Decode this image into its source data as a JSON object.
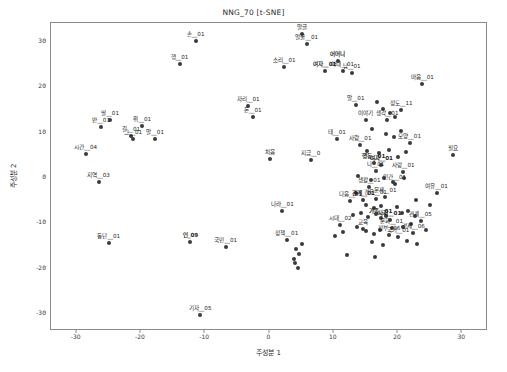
{
  "figure": {
    "title": "NNG_70 [t-SNE]",
    "background_color": "#ffffff",
    "frame_color": "#8a8a8a",
    "marker_color": "#3a3a3a"
  },
  "axes": {
    "xlabel": "주성분 1",
    "ylabel": "주성분 2",
    "xlim": [
      -34,
      34
    ],
    "ylim": [
      -34,
      34
    ],
    "xticks": [
      -30,
      -20,
      -10,
      0,
      10,
      20,
      30
    ],
    "yticks": [
      -30,
      -20,
      -10,
      0,
      10,
      20,
      30
    ],
    "xtick_labels": [
      "-30",
      "-20",
      "-10",
      "0",
      "10",
      "20",
      "30"
    ],
    "ytick_labels": [
      "-30",
      "-20",
      "-10",
      "0",
      "10",
      "20",
      "30"
    ],
    "grid": false
  },
  "chart_data": {
    "type": "scatter",
    "title": "NNG_70 [t-SNE]",
    "xlabel": "주성분 1",
    "ylabel": "주성분 2",
    "xlim": [
      -34,
      34
    ],
    "ylim": [
      -34,
      34
    ],
    "grid": false,
    "legend": null,
    "points": [
      {
        "label": "손__01",
        "x": -11.5,
        "y": 30.0,
        "bold": false
      },
      {
        "label": "말글",
        "x": 5.0,
        "y": 31.5,
        "bold": false
      },
      {
        "label": "얼굴__01",
        "x": 5.8,
        "y": 29.3,
        "bold": false
      },
      {
        "label": "행__01",
        "x": -14.0,
        "y": 25.0,
        "bold": false
      },
      {
        "label": "소리__01",
        "x": 2.3,
        "y": 24.2,
        "bold": false
      },
      {
        "label": "어머니",
        "x": 10.6,
        "y": 25.6,
        "bold": true
      },
      {
        "label": "여자__01",
        "x": 8.6,
        "y": 23.3,
        "bold": true
      },
      {
        "label": "아내__01",
        "x": 11.4,
        "y": 23.4,
        "bold": false
      },
      {
        "label": "남__01",
        "x": 12.8,
        "y": 23.0,
        "bold": false
      },
      {
        "label": "마음__01",
        "x": 23.8,
        "y": 20.5,
        "bold": false
      },
      {
        "label": "자리__01",
        "x": -3.3,
        "y": 15.6,
        "bold": false
      },
      {
        "label": "돈__01",
        "x": -2.6,
        "y": 13.3,
        "bold": false
      },
      {
        "label": "말__01",
        "x": 13.4,
        "y": 16.0,
        "bold": false
      },
      {
        "label": "정도__11",
        "x": 20.5,
        "y": 14.7,
        "bold": false
      },
      {
        "label": "이야기",
        "x": 15.0,
        "y": 12.6,
        "bold": false
      },
      {
        "label": "생각__01",
        "x": 18.3,
        "y": 12.5,
        "bold": false
      },
      {
        "label": "딸__01",
        "x": -24.8,
        "y": 12.6,
        "bold": false
      },
      {
        "label": "반__01",
        "x": -26.2,
        "y": 11.1,
        "bold": false
      },
      {
        "label": "위__01",
        "x": -19.8,
        "y": 11.3,
        "bold": false
      },
      {
        "label": "길__01",
        "x": -21.5,
        "y": 9.0,
        "bold": false
      },
      {
        "label": "그__01",
        "x": -21.2,
        "y": 8.4,
        "bold": false
      },
      {
        "label": "말__01",
        "x": -17.8,
        "y": 8.3,
        "bold": false
      },
      {
        "label": "태__01",
        "x": 10.5,
        "y": 8.3,
        "bold": false
      },
      {
        "label": "사람__01",
        "x": 14.1,
        "y": 7.1,
        "bold": false
      },
      {
        "label": "모양__01",
        "x": 21.8,
        "y": 7.6,
        "bold": false
      },
      {
        "label": "시간__04",
        "x": -28.6,
        "y": 5.1,
        "bold": false
      },
      {
        "label": "처음",
        "x": 0.0,
        "y": 4.0,
        "bold": false
      },
      {
        "label": "지금__0",
        "x": 6.4,
        "y": 3.7,
        "bold": false
      },
      {
        "label": "필요",
        "x": 28.6,
        "y": 4.8,
        "bold": false
      },
      {
        "label": "행동__01",
        "x": 16.2,
        "y": 3.1,
        "bold": true
      },
      {
        "label": "여자__01",
        "x": 17.4,
        "y": 2.6,
        "bold": true
      },
      {
        "label": "나__01",
        "x": 16.5,
        "y": 1.3,
        "bold": false
      },
      {
        "label": "사랑__01",
        "x": 20.8,
        "y": 1.1,
        "bold": false
      },
      {
        "label": "지역__03",
        "x": -26.6,
        "y": -1.0,
        "bold": false
      },
      {
        "label": "생활__01",
        "x": 15.5,
        "y": -2.2,
        "bold": false
      },
      {
        "label": "인간__01",
        "x": 19.5,
        "y": -1.6,
        "bold": false
      },
      {
        "label": "여유__01",
        "x": 26.0,
        "y": -3.5,
        "bold": false
      },
      {
        "label": "다음__01",
        "x": 12.6,
        "y": -5.2,
        "bold": false
      },
      {
        "label": "관계__01",
        "x": 14.6,
        "y": -5.0,
        "bold": true
      },
      {
        "label": "경우__01",
        "x": 16.5,
        "y": -4.8,
        "bold": false
      },
      {
        "label": "문제__01",
        "x": 18.0,
        "y": -4.5,
        "bold": false
      },
      {
        "label": "나라__01",
        "x": 2.0,
        "y": -7.5,
        "bold": false
      },
      {
        "label": "가족__01",
        "x": 17.3,
        "y": -9.0,
        "bold": true
      },
      {
        "label": "사회__01",
        "x": 18.7,
        "y": -9.4,
        "bold": true
      },
      {
        "label": "시대__02",
        "x": 11.0,
        "y": -10.6,
        "bold": false
      },
      {
        "label": "관계__05",
        "x": 23.5,
        "y": -9.8,
        "bold": false
      },
      {
        "label": "교육",
        "x": 14.5,
        "y": -11.4,
        "bold": false
      },
      {
        "label": "문화__01",
        "x": 19.0,
        "y": -11.2,
        "bold": false
      },
      {
        "label": "정부__06",
        "x": 18.6,
        "y": -12.8,
        "bold": false
      },
      {
        "label": "경제__06",
        "x": 22.4,
        "y": -12.4,
        "bold": false
      },
      {
        "label": "국가__01",
        "x": 20.0,
        "y": -13.3,
        "bold": false
      },
      {
        "label": "동단__01",
        "x": -25.0,
        "y": -14.6,
        "bold": false
      },
      {
        "label": "인_09",
        "x": -12.3,
        "y": -14.3,
        "bold": true
      },
      {
        "label": "정책__01",
        "x": 2.7,
        "y": -14.0,
        "bold": false
      },
      {
        "label": "국민__01",
        "x": -6.8,
        "y": -15.5,
        "bold": false
      },
      {
        "label": "기자__05",
        "x": -10.8,
        "y": -30.4,
        "bold": false
      }
    ],
    "extra_points": [
      {
        "x": 16.8,
        "y": 16.5
      },
      {
        "x": 17.6,
        "y": 15.0
      },
      {
        "x": 18.8,
        "y": 14.2
      },
      {
        "x": 19.6,
        "y": 13.2
      },
      {
        "x": 16.0,
        "y": 10.5
      },
      {
        "x": 18.2,
        "y": 9.6
      },
      {
        "x": 19.4,
        "y": 8.8
      },
      {
        "x": 20.4,
        "y": 10.1
      },
      {
        "x": 15.2,
        "y": 5.8
      },
      {
        "x": 17.0,
        "y": 5.2
      },
      {
        "x": 18.6,
        "y": 6.0
      },
      {
        "x": 20.0,
        "y": 4.4
      },
      {
        "x": 21.2,
        "y": 5.6
      },
      {
        "x": 13.8,
        "y": 0.2
      },
      {
        "x": 15.8,
        "y": -0.6
      },
      {
        "x": 17.8,
        "y": -0.2
      },
      {
        "x": 19.2,
        "y": -1.0
      },
      {
        "x": 21.0,
        "y": -0.2
      },
      {
        "x": 13.4,
        "y": -3.6
      },
      {
        "x": 15.0,
        "y": -6.2
      },
      {
        "x": 16.2,
        "y": -6.8
      },
      {
        "x": 17.4,
        "y": -6.4
      },
      {
        "x": 19.8,
        "y": -6.6
      },
      {
        "x": 21.6,
        "y": -7.4
      },
      {
        "x": 13.0,
        "y": -8.4
      },
      {
        "x": 14.2,
        "y": -8.0
      },
      {
        "x": 15.4,
        "y": -8.8
      },
      {
        "x": 16.6,
        "y": -8.2
      },
      {
        "x": 18.2,
        "y": -8.6
      },
      {
        "x": 20.6,
        "y": -8.0
      },
      {
        "x": 22.6,
        "y": -8.6
      },
      {
        "x": 13.6,
        "y": -11.0
      },
      {
        "x": 15.0,
        "y": -12.0
      },
      {
        "x": 16.2,
        "y": -12.6
      },
      {
        "x": 17.2,
        "y": -11.8
      },
      {
        "x": 20.8,
        "y": -11.0
      },
      {
        "x": 22.0,
        "y": -10.4
      },
      {
        "x": 24.4,
        "y": -11.6
      },
      {
        "x": 16.0,
        "y": -14.4
      },
      {
        "x": 17.6,
        "y": -15.0
      },
      {
        "x": 21.4,
        "y": -14.2
      },
      {
        "x": 23.0,
        "y": -14.8
      },
      {
        "x": 10.2,
        "y": -13.0
      },
      {
        "x": 11.4,
        "y": -12.2
      },
      {
        "x": 5.0,
        "y": -14.8
      },
      {
        "x": 4.2,
        "y": -16.0
      },
      {
        "x": 4.6,
        "y": -17.0
      },
      {
        "x": 3.8,
        "y": -18.0
      },
      {
        "x": 4.0,
        "y": -19.0
      },
      {
        "x": 4.4,
        "y": -20.0
      },
      {
        "x": 12.0,
        "y": -17.2
      },
      {
        "x": 16.4,
        "y": -17.6
      },
      {
        "x": 22.8,
        "y": -5.0
      },
      {
        "x": 25.0,
        "y": -6.2
      }
    ]
  }
}
